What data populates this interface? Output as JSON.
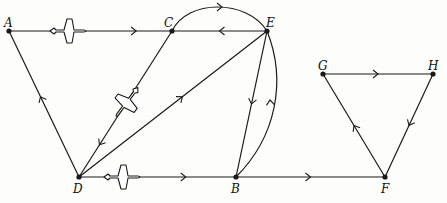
{
  "diagram": {
    "type": "directed-graph",
    "colors": {
      "line": "#1a1a1a",
      "background": "#fdfdfb"
    },
    "nodes": [
      {
        "id": "A",
        "label": "A",
        "x": 9,
        "y": 31,
        "lx": 4,
        "ly": 17
      },
      {
        "id": "C",
        "label": "C",
        "x": 172,
        "y": 31,
        "lx": 164,
        "ly": 17
      },
      {
        "id": "E",
        "label": "E",
        "x": 267,
        "y": 31,
        "lx": 266,
        "ly": 17
      },
      {
        "id": "D",
        "label": "D",
        "x": 79,
        "y": 177,
        "lx": 73,
        "ly": 183
      },
      {
        "id": "B",
        "label": "B",
        "x": 236,
        "y": 177,
        "lx": 231,
        "ly": 183
      },
      {
        "id": "F",
        "label": "F",
        "x": 385,
        "y": 177,
        "lx": 381,
        "ly": 183
      },
      {
        "id": "G",
        "label": "G",
        "x": 323,
        "y": 74,
        "lx": 318,
        "ly": 60
      },
      {
        "id": "H",
        "label": "H",
        "x": 433,
        "y": 74,
        "lx": 428,
        "ly": 60
      }
    ],
    "edges": [
      {
        "from": "A",
        "to": "C",
        "shape": "straight"
      },
      {
        "from": "E",
        "to": "C",
        "shape": "straight"
      },
      {
        "from": "C",
        "to": "E",
        "shape": "arc-above"
      },
      {
        "from": "D",
        "to": "A",
        "shape": "straight"
      },
      {
        "from": "C",
        "to": "D",
        "shape": "straight"
      },
      {
        "from": "D",
        "to": "E",
        "shape": "straight"
      },
      {
        "from": "E",
        "to": "B",
        "shape": "straight"
      },
      {
        "from": "B",
        "to": "E",
        "shape": "arc-right"
      },
      {
        "from": "D",
        "to": "B",
        "shape": "straight"
      },
      {
        "from": "B",
        "to": "F",
        "shape": "straight"
      },
      {
        "from": "F",
        "to": "G",
        "shape": "straight"
      },
      {
        "from": "G",
        "to": "H",
        "shape": "straight"
      },
      {
        "from": "H",
        "to": "F",
        "shape": "straight"
      }
    ],
    "icons": [
      {
        "name": "airplane-icon",
        "on_edge": "A-C",
        "x": 68,
        "y": 31,
        "rotate": 0
      },
      {
        "name": "airplane-icon",
        "on_edge": "C-D",
        "x": 127,
        "y": 102,
        "rotate": 127
      },
      {
        "name": "airplane-icon",
        "on_edge": "D-B",
        "x": 122,
        "y": 177,
        "rotate": 0
      }
    ]
  }
}
